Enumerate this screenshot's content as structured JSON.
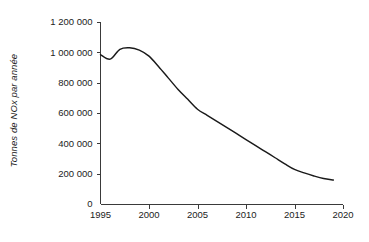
{
  "chart_data": {
    "type": "line",
    "title": "",
    "xlabel": "",
    "ylabel": "Tonnes de NOx par année",
    "xlim": [
      1995,
      2020
    ],
    "ylim": [
      0,
      1200000
    ],
    "grid": false,
    "legend": null,
    "x_ticks": [
      "1995",
      "2000",
      "2005",
      "2010",
      "2015",
      "2020"
    ],
    "x_tick_values": [
      1995,
      2000,
      2005,
      2010,
      2015,
      2020
    ],
    "y_ticks": [
      "0",
      "200 000",
      "400 000",
      "600 000",
      "800 000",
      "1 000 000",
      "1 200 000"
    ],
    "y_tick_values": [
      0,
      200000,
      400000,
      600000,
      800000,
      1000000,
      1200000
    ],
    "series": [
      {
        "name": "Tonnes de NOx par année",
        "color": "#1a1a1a",
        "x": [
          1995,
          1996,
          1997,
          1998,
          1999,
          2000,
          2001,
          2002,
          2003,
          2004,
          2005,
          2006,
          2007,
          2008,
          2009,
          2010,
          2011,
          2012,
          2013,
          2014,
          2015,
          2016,
          2017,
          2018,
          2019
        ],
        "values": [
          985000,
          955000,
          1020000,
          1030000,
          1015000,
          975000,
          905000,
          830000,
          755000,
          690000,
          625000,
          585000,
          545000,
          505000,
          465000,
          425000,
          385000,
          345000,
          305000,
          265000,
          228000,
          205000,
          185000,
          168000,
          158000
        ]
      }
    ]
  },
  "axis": {
    "y_label_text": "Tonnes de NOx par année"
  }
}
